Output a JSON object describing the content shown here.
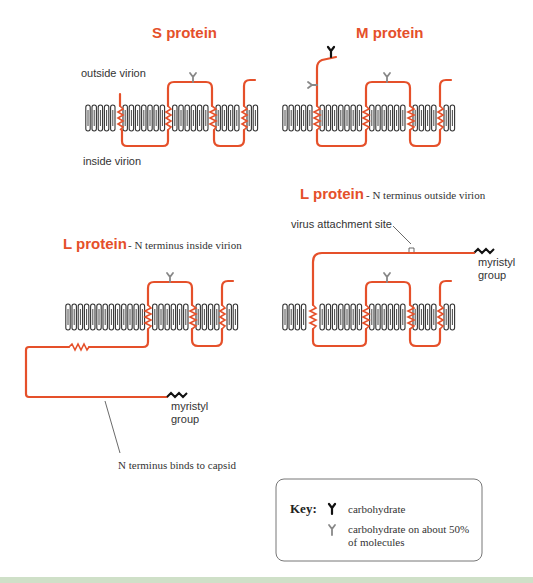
{
  "diagrams": {
    "s_protein": {
      "title": "S protein",
      "outside_label": "outside virion",
      "inside_label": "inside virion"
    },
    "m_protein": {
      "title": "M protein"
    },
    "l_protein_outside": {
      "title": "L protein",
      "subtitle": "- N terminus outside virion",
      "attachment_label": "virus attachment site",
      "myristyl_label_line1": "myristyl",
      "myristyl_label_line2": "group"
    },
    "l_protein_inside": {
      "title": "L protein",
      "subtitle": "- N terminus inside virion",
      "myristyl_label_line1": "myristyl",
      "myristyl_label_line2": "group",
      "capsid_label": "N terminus binds to capsid"
    }
  },
  "key": {
    "title": "Key:",
    "items": [
      {
        "icon": "carbohydrate-icon",
        "color": "#111111",
        "label_line1": "carbohydrate",
        "label_line2": ""
      },
      {
        "icon": "carbohydrate-partial-icon",
        "color": "#888888",
        "label_line1": "carbohydrate on about 50%",
        "label_line2": "of molecules"
      }
    ]
  },
  "colors": {
    "protein_chain": "#e5502a",
    "membrane": "#333333",
    "footer_band": "#cfe0c8"
  }
}
